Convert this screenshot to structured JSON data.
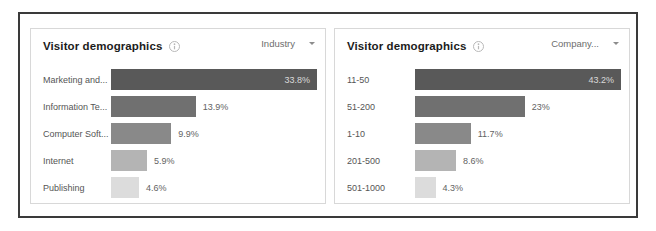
{
  "panels": [
    {
      "title": "Visitor demographics",
      "info_icon": "info-circle-icon",
      "dropdown": {
        "label": "Industry",
        "caret_icon": "chevron-down-icon"
      },
      "chart_data": {
        "type": "bar",
        "orientation": "horizontal",
        "title": "Visitor demographics",
        "xlabel": "",
        "ylabel": "",
        "grid": false,
        "legend": "none",
        "categories": [
          "Marketing and...",
          "Information Te...",
          "Computer Soft...",
          "Internet",
          "Publishing"
        ],
        "values": [
          33.8,
          13.9,
          9.9,
          5.9,
          4.6
        ],
        "value_labels": [
          "33.8%",
          "13.9%",
          "9.9%",
          "5.9%",
          "4.6%"
        ],
        "label_inside": [
          true,
          false,
          false,
          false,
          false
        ],
        "bar_colors": [
          "#595959",
          "#707070",
          "#898989",
          "#b4b4b4",
          "#dcdcdc"
        ],
        "xlim": [
          0,
          33.8
        ]
      }
    },
    {
      "title": "Visitor demographics",
      "info_icon": "info-circle-icon",
      "dropdown": {
        "label": "Company...",
        "caret_icon": "chevron-down-icon"
      },
      "chart_data": {
        "type": "bar",
        "orientation": "horizontal",
        "title": "Visitor demographics",
        "xlabel": "",
        "ylabel": "",
        "grid": false,
        "legend": "none",
        "categories": [
          "11-50",
          "51-200",
          "1-10",
          "201-500",
          "501-1000"
        ],
        "values": [
          43.2,
          23,
          11.7,
          8.6,
          4.3
        ],
        "value_labels": [
          "43.2%",
          "23%",
          "11.7%",
          "8.6%",
          "4.3%"
        ],
        "label_inside": [
          true,
          false,
          false,
          false,
          false
        ],
        "bar_colors": [
          "#595959",
          "#707070",
          "#898989",
          "#b4b4b4",
          "#dcdcdc"
        ],
        "xlim": [
          0,
          43.2
        ]
      }
    }
  ],
  "colors": {
    "frame": "#3a3a3a",
    "panel_border": "#d8d8d8",
    "background": "#ffffff",
    "label_text": "#555555",
    "value_text": "#636363"
  }
}
